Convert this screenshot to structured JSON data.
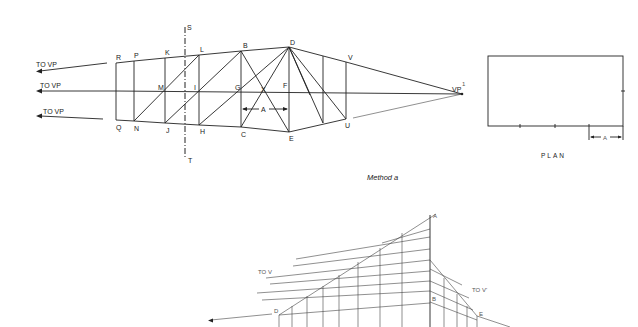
{
  "figure_top": {
    "caption": "Method a",
    "vp_label": "VP",
    "vp_prime_sup": "1",
    "arrows": [
      {
        "label": "TO  VP"
      },
      {
        "label": "TO  VP"
      },
      {
        "label": "TO  VP"
      }
    ],
    "section_line": {
      "top_label": "S",
      "bottom_label": "T"
    },
    "points": {
      "R": "R",
      "P": "P",
      "K": "K",
      "L": "L",
      "B": "B",
      "D": "D",
      "V": "V",
      "M": "M",
      "I": "I",
      "G": "G",
      "X": "X",
      "F": "F",
      "Q": "Q",
      "N": "N",
      "J": "J",
      "H": "H",
      "C": "C",
      "E": "E",
      "U": "U"
    },
    "dimension_label": "A"
  },
  "plan": {
    "title": "PLAN",
    "dimension_label": "A",
    "tick_count": 3
  },
  "figure_bottom": {
    "left_label": "TO  V",
    "right_label": "TO  V'",
    "points": {
      "A": "A",
      "B": "B",
      "D": "D",
      "E": "E"
    }
  }
}
